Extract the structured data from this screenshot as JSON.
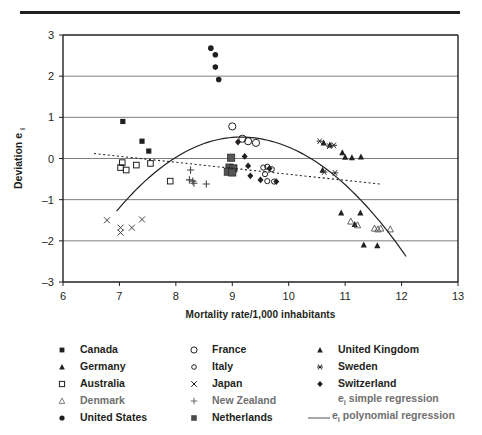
{
  "chart_data": {
    "type": "scatter",
    "title": "",
    "xlabel": "Mortality rate/1,000 inhabitants",
    "ylabel": "Deviation e",
    "ylabel_sub": "i",
    "xlim": [
      6,
      13
    ],
    "ylim": [
      -3,
      3
    ],
    "xticks": [
      6,
      7,
      8,
      9,
      10,
      11,
      12,
      13
    ],
    "yticks": [
      3,
      2,
      1,
      0,
      -1,
      -2,
      -3
    ],
    "grid": "horizontal",
    "legend_position": "below",
    "series": [
      {
        "name": "Canada",
        "marker": "filled-square",
        "points": [
          [
            7.06,
            0.9
          ],
          [
            7.4,
            0.42
          ],
          [
            7.52,
            0.18
          ]
        ]
      },
      {
        "name": "Germany",
        "marker": "filled-triangle",
        "points": [
          [
            10.73,
            0.33
          ],
          [
            10.95,
            0.14
          ],
          [
            11.0,
            0.03
          ],
          [
            11.12,
            0.02
          ],
          [
            11.28,
            0.04
          ],
          [
            10.93,
            -1.32
          ],
          [
            11.27,
            -1.32
          ],
          [
            11.17,
            -1.6
          ],
          [
            11.33,
            -2.1
          ],
          [
            11.57,
            -2.12
          ]
        ]
      },
      {
        "name": "Australia",
        "marker": "open-square",
        "points": [
          [
            7.05,
            -0.1
          ],
          [
            7.02,
            -0.22
          ],
          [
            7.12,
            -0.28
          ],
          [
            7.3,
            -0.16
          ],
          [
            7.55,
            -0.12
          ],
          [
            7.9,
            -0.55
          ]
        ]
      },
      {
        "name": "Denmark",
        "marker": "open-triangle",
        "points": [
          [
            11.1,
            -1.53
          ],
          [
            11.22,
            -1.62
          ],
          [
            11.52,
            -1.7
          ],
          [
            11.58,
            -1.72
          ],
          [
            11.63,
            -1.7
          ],
          [
            11.8,
            -1.72
          ]
        ]
      },
      {
        "name": "United States",
        "marker": "filled-circle",
        "points": [
          [
            8.62,
            2.68
          ],
          [
            8.7,
            2.52
          ],
          [
            8.7,
            2.22
          ],
          [
            8.76,
            1.92
          ]
        ]
      },
      {
        "name": "France",
        "marker": "open-circle-large",
        "points": [
          [
            9.0,
            0.78
          ],
          [
            9.18,
            0.48
          ],
          [
            9.28,
            0.42
          ],
          [
            9.42,
            0.38
          ]
        ]
      },
      {
        "name": "Italy",
        "marker": "open-circle-small",
        "points": [
          [
            9.55,
            -0.22
          ],
          [
            9.62,
            -0.2
          ],
          [
            9.58,
            -0.38
          ],
          [
            9.7,
            -0.26
          ],
          [
            9.62,
            -0.55
          ],
          [
            9.74,
            -0.56
          ]
        ]
      },
      {
        "name": "Japan",
        "marker": "cross-x",
        "points": [
          [
            6.78,
            -1.5
          ],
          [
            7.02,
            -1.68
          ],
          [
            7.02,
            -1.8
          ],
          [
            7.22,
            -1.68
          ],
          [
            7.4,
            -1.48
          ]
        ]
      },
      {
        "name": "New Zealand",
        "marker": "plus",
        "points": [
          [
            8.26,
            -0.28
          ],
          [
            8.24,
            -0.52
          ],
          [
            8.3,
            -0.55
          ],
          [
            8.32,
            -0.6
          ],
          [
            8.54,
            -0.62
          ]
        ]
      },
      {
        "name": "Netherlands",
        "marker": "filled-square-grey",
        "points": [
          [
            8.98,
            0.02
          ],
          [
            8.95,
            -0.22
          ],
          [
            9.02,
            -0.24
          ],
          [
            8.92,
            -0.32
          ],
          [
            9.0,
            -0.34
          ]
        ]
      },
      {
        "name": "United Kingdom",
        "marker": "filled-triangle-uk",
        "points": [
          [
            10.62,
            0.38
          ],
          [
            10.6,
            -0.28
          ]
        ]
      },
      {
        "name": "Sweden",
        "marker": "asterisk",
        "points": [
          [
            10.55,
            0.42
          ],
          [
            10.72,
            0.3
          ],
          [
            10.8,
            0.32
          ],
          [
            10.63,
            -0.33
          ],
          [
            10.82,
            -0.35
          ]
        ]
      },
      {
        "name": "Switzerland",
        "marker": "filled-diamond",
        "points": [
          [
            9.1,
            0.4
          ],
          [
            9.22,
            0.05
          ],
          [
            9.28,
            -0.18
          ],
          [
            9.32,
            -0.42
          ],
          [
            9.5,
            -0.52
          ],
          [
            9.66,
            -0.24
          ],
          [
            9.78,
            -0.56
          ]
        ]
      }
    ],
    "fits": [
      {
        "name": "e_i simple regression",
        "style": "dotted",
        "type": "linear",
        "x_range": [
          6.55,
          11.62
        ],
        "y_at_range": [
          0.12,
          -0.62
        ]
      },
      {
        "name": "e_i polynomial regression",
        "style": "solid",
        "type": "quadratic",
        "x_range": [
          6.95,
          12.08
        ],
        "vertex": [
          9.15,
          0.52
        ],
        "y_at_range": [
          -1.28,
          -2.38
        ]
      }
    ]
  },
  "legend": {
    "columns": [
      {
        "items": [
          {
            "marker": "filled-square",
            "label": "Canada",
            "faded": false
          },
          {
            "marker": "filled-triangle",
            "label": "Germany",
            "faded": false
          },
          {
            "marker": "open-square",
            "label": "Australia",
            "faded": false
          },
          {
            "marker": "open-triangle",
            "label": "Denmark",
            "faded": true
          },
          {
            "marker": "filled-circle",
            "label": "United States",
            "faded": false
          }
        ]
      },
      {
        "items": [
          {
            "marker": "open-circle-large",
            "label": "France",
            "faded": false
          },
          {
            "marker": "open-circle-small",
            "label": "Italy",
            "faded": false
          },
          {
            "marker": "cross-x",
            "label": "Japan",
            "faded": false
          },
          {
            "marker": "plus",
            "label": "New Zealand",
            "faded": true
          },
          {
            "marker": "filled-square-grey",
            "label": "Netherlands",
            "faded": false
          }
        ]
      },
      {
        "items": [
          {
            "marker": "filled-triangle-uk",
            "label": "United Kingdom",
            "faded": false
          },
          {
            "marker": "asterisk",
            "label": "Sweden",
            "faded": false
          },
          {
            "marker": "filled-diamond",
            "label": "Switzerland",
            "faded": false
          },
          {
            "marker": "none",
            "label": "e",
            "sub": "i",
            "label2": " simple regression",
            "faded": true
          },
          {
            "marker": "line-solid",
            "label": "e",
            "sub": "i",
            "label2": " polynomial regression",
            "faded": true
          }
        ]
      }
    ]
  },
  "colors": {
    "ink": "#231f20",
    "grid": "#6f6f6f",
    "faded": "#6f6f6f"
  }
}
